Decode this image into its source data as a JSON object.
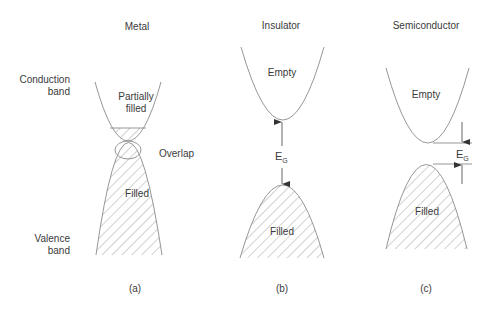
{
  "diagram": {
    "side_labels": {
      "conduction": [
        "Conduction",
        "band"
      ],
      "valence": [
        "Valence",
        "band"
      ]
    },
    "panels": [
      {
        "id": "a",
        "heading": "Metal",
        "caption": "(a)",
        "conduction_label": [
          "Partially",
          "filled"
        ],
        "overlap_label": "Overlap",
        "valence_label": "Filled"
      },
      {
        "id": "b",
        "heading": "Insulator",
        "caption": "(b)",
        "conduction_label": "Empty",
        "gap_label": "E",
        "gap_subscript": "G",
        "valence_label": "Filled"
      },
      {
        "id": "c",
        "heading": "Semiconductor",
        "caption": "(c)",
        "conduction_label": "Empty",
        "gap_label": "E",
        "gap_subscript": "G",
        "valence_label": "Filled"
      }
    ],
    "colors": {
      "line": "#8a8a8a",
      "hatch": "#9a9a9a",
      "text": "#3a3a3a"
    }
  }
}
